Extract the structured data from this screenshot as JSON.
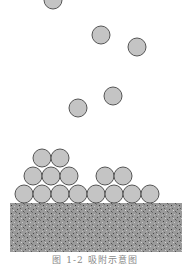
{
  "figure": {
    "caption": "图 1-2  吸附示意图",
    "colors": {
      "particle_fill": "#c4c4c4",
      "particle_stroke": "#555555",
      "substrate": "#9a9a9a",
      "background": "#ffffff"
    },
    "substrate": {
      "x": 10,
      "y": 203,
      "width": 172,
      "height": 49
    },
    "particle_radius": 9,
    "free_particles": [
      {
        "cx": 53,
        "cy": 0
      },
      {
        "cx": 101,
        "cy": 35
      },
      {
        "cx": 137,
        "cy": 47
      },
      {
        "cx": 113,
        "cy": 96
      },
      {
        "cx": 78,
        "cy": 108
      }
    ],
    "adsorbed_particles": [
      {
        "cx": 24,
        "cy": 194
      },
      {
        "cx": 42,
        "cy": 194
      },
      {
        "cx": 60,
        "cy": 194
      },
      {
        "cx": 78,
        "cy": 194
      },
      {
        "cx": 96,
        "cy": 194
      },
      {
        "cx": 114,
        "cy": 194
      },
      {
        "cx": 132,
        "cy": 194
      },
      {
        "cx": 150,
        "cy": 194
      },
      {
        "cx": 33,
        "cy": 176
      },
      {
        "cx": 51,
        "cy": 176
      },
      {
        "cx": 69,
        "cy": 176
      },
      {
        "cx": 105,
        "cy": 176
      },
      {
        "cx": 123,
        "cy": 176
      },
      {
        "cx": 42,
        "cy": 158
      },
      {
        "cx": 60,
        "cy": 158
      }
    ]
  }
}
